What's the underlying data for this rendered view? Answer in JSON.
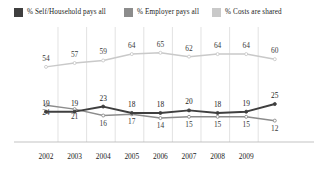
{
  "legend": {
    "items": [
      {
        "label": "% Self/Household pays all",
        "color": "#3f3f3f",
        "key": "self"
      },
      {
        "label": "% Employer pays all",
        "color": "#8c8c8c",
        "key": "employer"
      },
      {
        "label": "% Costs are shared",
        "color": "#c9c9c9",
        "key": "shared"
      }
    ]
  },
  "axis": {
    "x_ticks": [
      "2002",
      "2003",
      "2004",
      "2005",
      "2006",
      "2007",
      "2008",
      "2009"
    ]
  },
  "chart_data": {
    "type": "line",
    "title": "",
    "subtitle": "",
    "xlabel": "",
    "ylabel": "",
    "grid": true,
    "grid_axis": "x",
    "legend_position": "top",
    "ylim": [
      0,
      75
    ],
    "x": [
      "2002",
      "2003",
      "2004",
      "2005",
      "2006",
      "2007",
      "2008",
      "2009",
      ""
    ],
    "categories": [
      "2002",
      "2003",
      "2004",
      "2005",
      "2006",
      "2007",
      "2008",
      "2009",
      ""
    ],
    "series": [
      {
        "name": "% Costs are shared",
        "color": "#c9c9c9",
        "label_color": "#3a3a3a",
        "label_position": "above",
        "values": [
          54,
          57,
          59,
          64,
          65,
          62,
          64,
          64,
          60
        ]
      },
      {
        "name": "% Self/Household pays all",
        "color": "#3f3f3f",
        "label_color": "#1a1a1a",
        "label_position": "above",
        "values": [
          19,
          19,
          23,
          18,
          18,
          20,
          18,
          19,
          25
        ]
      },
      {
        "name": "% Employer pays all",
        "color": "#8c8c8c",
        "label_color": "#3a3a3a",
        "label_position": "below",
        "values": [
          24,
          21,
          16,
          17,
          14,
          15,
          15,
          15,
          12
        ]
      }
    ],
    "point_labels": {
      "shared": [
        54,
        57,
        59,
        64,
        65,
        62,
        64,
        64,
        60
      ],
      "self": [
        19,
        19,
        23,
        18,
        18,
        20,
        18,
        19,
        25
      ],
      "employer": [
        24,
        21,
        16,
        17,
        14,
        15,
        15,
        15,
        12
      ]
    }
  }
}
